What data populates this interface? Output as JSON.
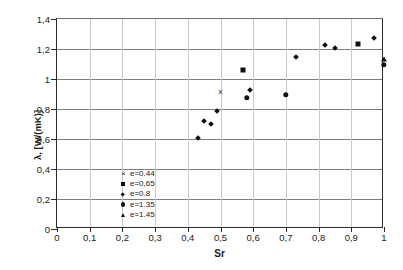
{
  "chart_data": {
    "type": "scatter",
    "title": "",
    "xlabel": "Sr",
    "ylabel": "λ, [W/(mK)]",
    "xlim": [
      0,
      1
    ],
    "ylim": [
      0,
      1.4
    ],
    "xticks": [
      "0",
      "0,1",
      "0,2",
      "0,3",
      "0,4",
      "0,5",
      "0,6",
      "0,7",
      "0,8",
      "0,9",
      "1"
    ],
    "xtick_values": [
      0,
      0.1,
      0.2,
      0.3,
      0.4,
      0.5,
      0.6,
      0.7,
      0.8,
      0.9,
      1
    ],
    "yticks": [
      "0",
      "0,2",
      "0,4",
      "0,6",
      "0,8",
      "1",
      "1,2",
      "1,4"
    ],
    "ytick_values": [
      0,
      0.2,
      0.4,
      0.6,
      0.8,
      1.0,
      1.2,
      1.4
    ],
    "grid": "horizontal-and-vertical",
    "legend_position": "lower-left-inside",
    "marker_color": "#111111",
    "series": [
      {
        "name": "e=0.44",
        "marker": "cross",
        "points": [
          {
            "x": 0.5,
            "y": 0.915
          }
        ]
      },
      {
        "name": "e=0,65",
        "marker": "square",
        "points": [
          {
            "x": 0.57,
            "y": 1.057
          },
          {
            "x": 0.92,
            "y": 1.233
          }
        ]
      },
      {
        "name": "e=0.8",
        "marker": "diamond",
        "points": [
          {
            "x": 0.43,
            "y": 0.605
          },
          {
            "x": 0.45,
            "y": 0.718
          },
          {
            "x": 0.47,
            "y": 0.697
          },
          {
            "x": 0.49,
            "y": 0.787
          },
          {
            "x": 0.59,
            "y": 0.927
          },
          {
            "x": 0.73,
            "y": 1.147
          },
          {
            "x": 0.82,
            "y": 1.224
          },
          {
            "x": 0.85,
            "y": 1.205
          },
          {
            "x": 0.97,
            "y": 1.272
          }
        ]
      },
      {
        "name": "e=1.35",
        "marker": "circle",
        "points": [
          {
            "x": 0.58,
            "y": 0.876
          },
          {
            "x": 0.7,
            "y": 0.893
          },
          {
            "x": 1.0,
            "y": 1.095
          }
        ]
      },
      {
        "name": "e=1.45",
        "marker": "triangle",
        "points": [
          {
            "x": 1.0,
            "y": 1.133
          }
        ]
      }
    ]
  }
}
